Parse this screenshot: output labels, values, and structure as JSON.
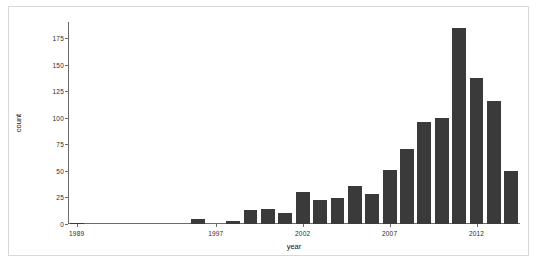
{
  "chart_data": {
    "type": "bar",
    "title": "",
    "subtitle": "",
    "xlabel": "year",
    "ylabel": "count",
    "grid": false,
    "legend": null,
    "xlim": [
      1988.5,
      2014.5
    ],
    "ylim": [
      0,
      190
    ],
    "yticks": [
      0,
      25,
      50,
      75,
      100,
      125,
      150,
      175
    ],
    "ytick_labels": [
      "0",
      "25",
      "50",
      "75",
      "100",
      "125",
      "150",
      "175"
    ],
    "xticks": [
      1989,
      1997,
      2002,
      2007,
      2012
    ],
    "xtick_labels": [
      "1989",
      "1997",
      "2002",
      "2007",
      "2012"
    ],
    "bar_color": "#3a3a3a",
    "axis_color": "#6b6b6b",
    "background_color": "#ffffff",
    "categories": [
      1989,
      1990,
      1991,
      1992,
      1993,
      1994,
      1995,
      1996,
      1997,
      1998,
      1999,
      2000,
      2001,
      2002,
      2003,
      2004,
      2005,
      2006,
      2007,
      2008,
      2009,
      2010,
      2011,
      2012,
      2013,
      2014
    ],
    "values": [
      1,
      0,
      0,
      0,
      0,
      0,
      0,
      5,
      0,
      3,
      13,
      14,
      10,
      30,
      23,
      24,
      36,
      28,
      51,
      71,
      96,
      100,
      184,
      137,
      116,
      50
    ]
  },
  "figure": {
    "frame_border_color": "#d8d8d8"
  }
}
